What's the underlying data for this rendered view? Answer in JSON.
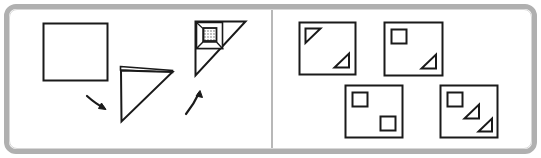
{
  "puzzle": {
    "type": "paper-folding-punch",
    "title": "Paper folding visual reasoning item",
    "frame": {
      "border_color": "#b0b0b0",
      "inner_border_color": "#d8d8d8",
      "background": "#ffffff",
      "divider_color": "#b8b8b8"
    },
    "ink_color": "#1a1a1a",
    "prompt_panel": {
      "name": "stimulus",
      "steps": [
        {
          "index": 1,
          "name": "unfolded-square",
          "shape": "square",
          "label": "",
          "description": "Blank square sheet of paper"
        },
        {
          "index": 2,
          "name": "folded-triangle",
          "shape": "triangle",
          "label": "",
          "description": "Sheet folded once along the diagonal forming a triangle with a visible flap"
        },
        {
          "index": 3,
          "name": "punched-triangle",
          "shape": "triangle-with-hole",
          "label": "",
          "description": "Folded triangle with corner folded in and one square hole punched near top-left"
        }
      ],
      "arrows": [
        {
          "name": "fold-arrow",
          "direction": "down-right",
          "label": ""
        },
        {
          "name": "punch-arrow",
          "direction": "up-right",
          "label": ""
        }
      ],
      "hole": {
        "name": "punched-hole",
        "shape": "square",
        "fill": "stippled",
        "count": 1
      }
    },
    "answer_panel": {
      "name": "answer-options",
      "option_count": 4,
      "options": [
        {
          "id": "A",
          "label": "",
          "row": 1,
          "column": 1,
          "marks": [
            {
              "shape": "triangle",
              "position": "top-left",
              "orientation": "right-angle-top-left"
            },
            {
              "shape": "triangle",
              "position": "bottom-right",
              "orientation": "right-angle-bottom-right"
            }
          ]
        },
        {
          "id": "B",
          "label": "",
          "row": 1,
          "column": 2,
          "marks": [
            {
              "shape": "square",
              "position": "top-left",
              "orientation": "upright"
            },
            {
              "shape": "triangle",
              "position": "bottom-right",
              "orientation": "right-angle-bottom-right"
            }
          ]
        },
        {
          "id": "C",
          "label": "",
          "row": 2,
          "column": 1,
          "marks": [
            {
              "shape": "square",
              "position": "top-left",
              "orientation": "upright"
            },
            {
              "shape": "square",
              "position": "bottom-right",
              "orientation": "upright"
            }
          ]
        },
        {
          "id": "D",
          "label": "",
          "row": 2,
          "column": 2,
          "marks": [
            {
              "shape": "square",
              "position": "top-left",
              "orientation": "upright"
            },
            {
              "shape": "triangle",
              "position": "center",
              "orientation": "right-angle-bottom-right"
            },
            {
              "shape": "triangle",
              "position": "bottom-right",
              "orientation": "right-angle-bottom-right"
            }
          ]
        }
      ]
    }
  }
}
